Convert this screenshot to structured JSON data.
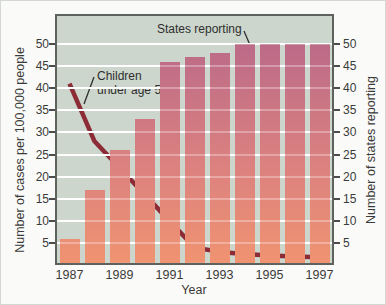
{
  "chart_data": {
    "type": "bar",
    "subtype": "combo bar + line, dual y-axes",
    "title": "",
    "xlabel": "Year",
    "ylabel_left": "Number of cases per 100,000 people",
    "ylabel_right": "Number of states reporting",
    "categories": [
      1987,
      1988,
      1989,
      1990,
      1991,
      1992,
      1993,
      1994,
      1995,
      1996,
      1997
    ],
    "x_tick_labels": [
      "1987",
      "1989",
      "1991",
      "1993",
      "1995",
      "1997"
    ],
    "y_ticks": [
      5,
      10,
      15,
      20,
      25,
      30,
      35,
      40,
      45,
      50
    ],
    "y_axis_range": [
      0.5,
      56.3
    ],
    "grid": "horizontal white gridlines every 5 units",
    "legend_position": "in-plot text annotations with pointer lines",
    "series": [
      {
        "name": "States reporting",
        "type": "bar",
        "axis": "right",
        "values": [
          6,
          17,
          26,
          33,
          46,
          47,
          48,
          50,
          50,
          50,
          50
        ]
      },
      {
        "name": "Children under age 5",
        "type": "line",
        "axis": "left",
        "values": [
          41,
          28,
          22,
          16,
          10,
          4,
          3,
          2.5,
          2.2,
          2,
          1.8
        ]
      }
    ],
    "annotations": {
      "states": {
        "text": "States reporting"
      },
      "children": {
        "line1": "Children",
        "line2": "under age 5"
      }
    },
    "colors": {
      "plot_background": "#ccd6cc",
      "gridline": "#ffffff",
      "bar_gradient_bottom": "#f09371",
      "bar_gradient_mid": "#da8080",
      "bar_gradient_top": "#bd6c88",
      "line": "#8c2c36",
      "frame": "#5d625c",
      "pointer": "#2f2f2f",
      "text": "#3a3a3a"
    }
  }
}
